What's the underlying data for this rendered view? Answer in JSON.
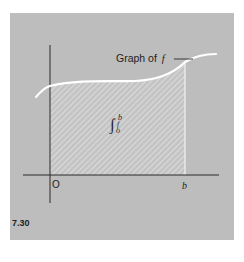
{
  "figure": {
    "number": "7.30",
    "curve_label": "Graph of",
    "curve_label_var": "f",
    "origin_label": "O",
    "upper_limit_label": "b",
    "integral": {
      "symbol": "∫",
      "upper": "b",
      "lower": "o",
      "integrand": "f"
    },
    "colors": {
      "panel": "#bdbdbd",
      "curve": "#ffffff",
      "hatch": "#e4e4e4",
      "axes": "#2a2a2a",
      "text": "#1e1e1e"
    }
  }
}
